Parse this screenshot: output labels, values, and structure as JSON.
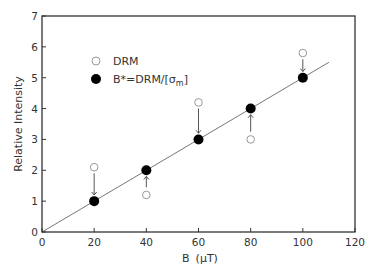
{
  "chart_data": {
    "type": "scatter",
    "title": "",
    "xlabel": "B (μT)",
    "ylabel": "Relative Intensity",
    "xlim": [
      0,
      120
    ],
    "ylim": [
      0,
      7
    ],
    "xticks": [
      0,
      20,
      40,
      60,
      80,
      100,
      120
    ],
    "yticks": [
      0,
      1,
      2,
      3,
      4,
      5,
      6,
      7
    ],
    "grid": false,
    "legend_position": "upper-left",
    "series": [
      {
        "name": "DRM",
        "marker": "open-circle",
        "x": [
          20,
          40,
          60,
          80,
          100
        ],
        "y": [
          2.1,
          1.2,
          4.2,
          3.0,
          5.8
        ]
      },
      {
        "name": "B*=DRM/[σm]",
        "marker": "filled-circle",
        "x": [
          20,
          40,
          60,
          80,
          100
        ],
        "y": [
          1,
          2,
          3,
          4,
          5
        ]
      }
    ],
    "fit_line": {
      "x": [
        0,
        110
      ],
      "y": [
        0,
        5.5
      ]
    },
    "annotations": [
      {
        "type": "arrow",
        "from": [
          20,
          1.9
        ],
        "to": [
          20,
          1.2
        ],
        "direction": "down"
      },
      {
        "type": "arrow",
        "from": [
          40,
          1.45
        ],
        "to": [
          40,
          1.8
        ],
        "direction": "up"
      },
      {
        "type": "arrow",
        "from": [
          60,
          4.0
        ],
        "to": [
          60,
          3.2
        ],
        "direction": "down"
      },
      {
        "type": "arrow",
        "from": [
          80,
          3.25
        ],
        "to": [
          80,
          3.8
        ],
        "direction": "up"
      },
      {
        "type": "arrow",
        "from": [
          100,
          5.6
        ],
        "to": [
          100,
          5.2
        ],
        "direction": "down"
      }
    ]
  },
  "legend": {
    "items": [
      {
        "label": "DRM",
        "marker": "open-circle"
      },
      {
        "label_main": "B*=DRM/[σ",
        "label_sub": "m",
        "label_end": "]",
        "marker": "filled-circle"
      }
    ]
  },
  "axes": {
    "xlabel_main": "B",
    "xlabel_unit": "(μT)",
    "ylabel": "Relative Intensity"
  },
  "colors": {
    "axis": "#333333",
    "filled_marker": "#000000",
    "open_marker": "#999999",
    "line": "#666666"
  }
}
